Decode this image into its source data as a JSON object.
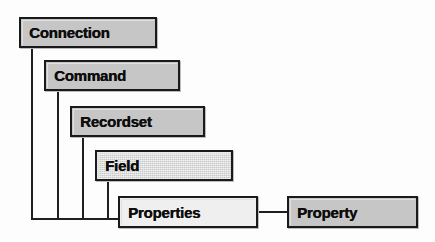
{
  "diagram": {
    "type": "hierarchy-cascade",
    "background_color": "#fdfdfd",
    "border_color": "#1a1a1a",
    "fill_gray": "#c6c6c6",
    "fill_light": "#efefef",
    "nodes": [
      {
        "id": "connection",
        "label": "Connection",
        "x": 19,
        "y": 17,
        "w": 138,
        "h": 31,
        "fill": "#c6c6c6",
        "style": "gray"
      },
      {
        "id": "command",
        "label": "Command",
        "x": 44,
        "y": 60,
        "w": 136,
        "h": 31,
        "fill": "#c6c6c6",
        "style": "gray"
      },
      {
        "id": "recordset",
        "label": "Recordset",
        "x": 70,
        "y": 106,
        "w": 135,
        "h": 31,
        "fill": "#c6c6c6",
        "style": "gray"
      },
      {
        "id": "field",
        "label": "Field",
        "x": 95,
        "y": 150,
        "w": 138,
        "h": 31,
        "fill": "#c9c9c9",
        "style": "dither"
      },
      {
        "id": "properties",
        "label": "Properties",
        "x": 118,
        "y": 196,
        "w": 140,
        "h": 32,
        "fill": "#efefef",
        "style": "light"
      },
      {
        "id": "property",
        "label": "Property",
        "x": 287,
        "y": 196,
        "w": 131,
        "h": 32,
        "fill": "#c6c6c6",
        "style": "gray"
      }
    ],
    "connectors": [
      {
        "id": "connection-stem",
        "orient": "v",
        "x": 31,
        "y": 48,
        "len": 172
      },
      {
        "id": "command-stem",
        "orient": "v",
        "x": 57,
        "y": 91,
        "len": 129
      },
      {
        "id": "recordset-stem",
        "orient": "v",
        "x": 82,
        "y": 137,
        "len": 83
      },
      {
        "id": "field-stem",
        "orient": "v",
        "x": 107,
        "y": 181,
        "len": 39
      },
      {
        "id": "bus-horizontal",
        "orient": "h",
        "x": 31,
        "y": 218,
        "len": 88
      },
      {
        "id": "properties-to-property",
        "orient": "h",
        "x": 258,
        "y": 211,
        "len": 30
      }
    ]
  }
}
